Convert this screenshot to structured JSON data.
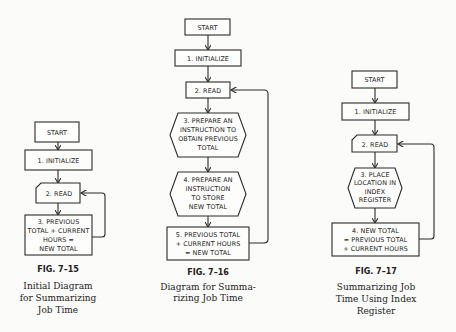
{
  "figures": [
    {
      "id": "fig-7-15",
      "label": "FIG. 7–15",
      "caption": [
        "Initial Diagram",
        "for  Summarizing",
        "Job Time"
      ],
      "steps": [
        {
          "shape": "terminal",
          "lines": [
            "START"
          ]
        },
        {
          "shape": "process",
          "lines": [
            "1.  INITIALIZE"
          ]
        },
        {
          "shape": "input",
          "lines": [
            "2.  READ"
          ]
        },
        {
          "shape": "process",
          "lines": [
            "3.  PREVIOUS",
            "TOTAL + CURRENT",
            "HOURS =",
            "NEW TOTAL"
          ]
        }
      ],
      "loop": "step 3 returns to step 2"
    },
    {
      "id": "fig-7-16",
      "label": "FIG. 7–16",
      "caption": [
        "Diagram  for  Summa-",
        "rizing  Job  Time"
      ],
      "steps": [
        {
          "shape": "terminal",
          "lines": [
            "START"
          ]
        },
        {
          "shape": "process",
          "lines": [
            "1.  INITIALIZE"
          ]
        },
        {
          "shape": "process",
          "lines": [
            "2.  READ"
          ]
        },
        {
          "shape": "preparation",
          "lines": [
            "3.  PREPARE AN",
            "INSTRUCTION TO",
            "OBTAIN PREVIOUS",
            "TOTAL"
          ]
        },
        {
          "shape": "preparation",
          "lines": [
            "4.  PREPARE AN",
            "INSTRUCTION",
            "TO STORE",
            "NEW TOTAL"
          ]
        },
        {
          "shape": "process",
          "lines": [
            "5.  PREVIOUS TOTAL",
            "+ CURRENT HOURS",
            "= NEW TOTAL"
          ]
        }
      ],
      "loop": "step 5 returns to step 2"
    },
    {
      "id": "fig-7-17",
      "label": "FIG. 7–17",
      "caption": [
        "Summarizing   Job",
        "Time Using Index",
        "Register"
      ],
      "steps": [
        {
          "shape": "terminal",
          "lines": [
            "START"
          ]
        },
        {
          "shape": "process",
          "lines": [
            "1.  INITIALIZE"
          ]
        },
        {
          "shape": "input",
          "lines": [
            "2.  READ"
          ]
        },
        {
          "shape": "preparation",
          "lines": [
            "3.  PLACE",
            "LOCATION IN",
            "INDEX",
            "REGISTER"
          ]
        },
        {
          "shape": "process",
          "lines": [
            "4.  NEW TOTAL",
            "= PREVIOUS TOTAL",
            "+ CURRENT HOURS"
          ]
        }
      ],
      "loop": "step 4 returns to step 2"
    }
  ]
}
